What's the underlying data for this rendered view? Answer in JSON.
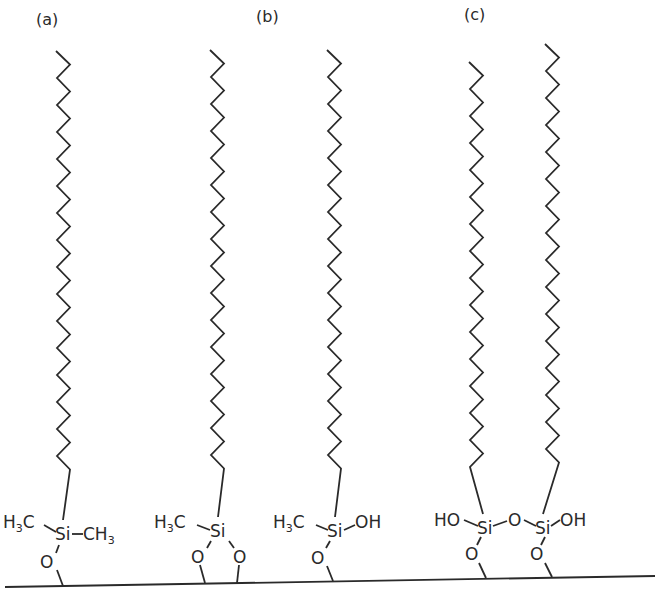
{
  "diagram": {
    "type": "chemical-structure",
    "colors": {
      "ink": "#2a2a2a",
      "background": "#ffffff"
    },
    "panels": [
      {
        "id": "a",
        "label": "(a)"
      },
      {
        "id": "b",
        "label": "(b)"
      },
      {
        "id": "c",
        "label": "(c)"
      }
    ],
    "molecules": [
      {
        "panel": "a",
        "silicon": "Si",
        "left_group": {
          "main": "H",
          "sub": "3",
          "tail": "C"
        },
        "right_group": {
          "main": "CH",
          "sub": "3"
        },
        "oxygens": [
          "O"
        ]
      },
      {
        "panel": "b",
        "silicon": "Si",
        "left_group": {
          "main": "H",
          "sub": "3",
          "tail": "C"
        },
        "oxygens": [
          "O",
          "O"
        ]
      },
      {
        "panel": "b",
        "silicon": "Si",
        "left_group": {
          "main": "H",
          "sub": "3",
          "tail": "C"
        },
        "right_group": {
          "main": "OH"
        },
        "oxygens": [
          "O"
        ]
      },
      {
        "panel": "c",
        "silicon": "Si",
        "left_group": {
          "main": "HO"
        },
        "bridge": "O",
        "oxygens": [
          "O"
        ]
      },
      {
        "panel": "c",
        "silicon": "Si",
        "right_group": {
          "main": "OH"
        },
        "oxygens": [
          "O"
        ]
      }
    ],
    "substrate": {
      "label": "surface"
    }
  }
}
